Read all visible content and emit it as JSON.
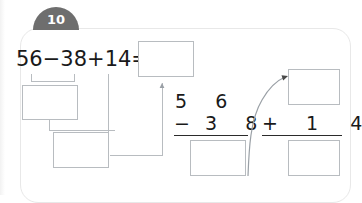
{
  "exercise": {
    "number_badge": "10",
    "equation": {
      "operand_1": "56",
      "operator_1": "−",
      "operand_2": "38",
      "operator_2": "+",
      "operand_3": "14",
      "equals": "=",
      "full_text": "56−38+14="
    },
    "blanks": {
      "final_answer": "",
      "partial_difference_upper": "",
      "partial_difference_lower": "",
      "subtraction_result": "",
      "addition_augend": "",
      "addition_result": ""
    }
  },
  "vertical_subtraction": {
    "minuend_tens": "5",
    "minuend_ones": "6",
    "operator": "−",
    "subtrahend_tens": "3",
    "subtrahend_ones": "8"
  },
  "vertical_addition": {
    "operator": "+",
    "addend_tens": "1",
    "addend_ones": "4"
  },
  "colors": {
    "badge_fill": "#6e6e6e",
    "badge_text": "#ffffff",
    "panel_border": "#e8e8e8",
    "box_border": "#b8bcc0",
    "text": "#1a1a1a",
    "rule": "#2b2b2b",
    "connector": "#b8bcc0",
    "arrow": "#9aa0a6"
  }
}
